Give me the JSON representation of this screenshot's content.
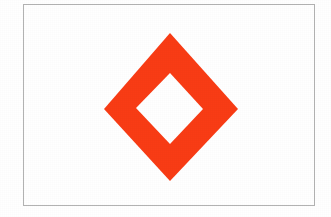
{
  "image": {
    "title": "Diamond Outline Symbol",
    "width": 331,
    "height": 217,
    "background_color": "#FFFFFF",
    "description": "A hollow red-orange diamond (rhombus outline) centered on a white field inside a thin gray rectangular border."
  },
  "frame": {
    "name": "image-border",
    "stroke_color": "#B3B3B3",
    "stroke_width": 1,
    "x": 23,
    "y": 4,
    "width": 292,
    "height": 202
  },
  "shape": {
    "name": "hollow-diamond",
    "kind": "rhombus-outline",
    "fill_color": "#F93C15",
    "hole_color": "#FFFFFF",
    "outer_points": "170,33 238,109 170,181 104,109",
    "inner_points": "170,73 203,109 170,144 136,108",
    "outer_vertices": {
      "top": [
        170,
        33
      ],
      "right": [
        238,
        109
      ],
      "bottom": [
        170,
        181
      ],
      "left": [
        104,
        109
      ]
    },
    "inner_vertices": {
      "top": [
        170,
        73
      ],
      "right": [
        203,
        109
      ],
      "bottom": [
        170,
        144
      ],
      "left": [
        136,
        108
      ]
    },
    "outer_width": 134,
    "outer_height": 148,
    "inner_width": 67,
    "inner_height": 71,
    "center": [
      170,
      107
    ]
  }
}
